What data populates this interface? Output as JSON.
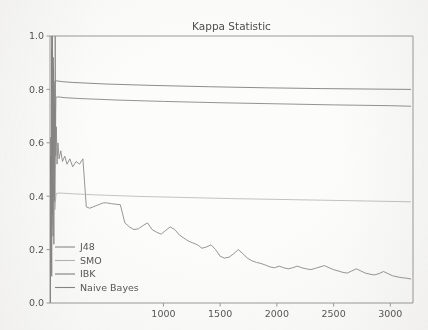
{
  "figure": {
    "title": "Kappa Statistic",
    "background_color": "#fdfdfc"
  },
  "chart_data": {
    "type": "line",
    "title": "Kappa Statistic",
    "xlabel": "",
    "ylabel": "",
    "xlim": [
      0,
      3200
    ],
    "ylim": [
      0.0,
      1.0
    ],
    "grid": false,
    "legend_position": "lower left",
    "xticks": [
      1000,
      1500,
      2000,
      2500,
      3000
    ],
    "xtick_labels": [
      "1000",
      "1500",
      "2000",
      "2500",
      "3000"
    ],
    "yticks": [
      0.0,
      0.2,
      0.4,
      0.6,
      0.8,
      1.0
    ],
    "ytick_labels": [
      "0.0",
      "0.2",
      "0.4",
      "0.6",
      "0.8",
      "1.0"
    ],
    "series": [
      {
        "name": "J48",
        "color": "#8a8886",
        "x": [
          2,
          6,
          10,
          14,
          18,
          22,
          26,
          30,
          34,
          38,
          42,
          46,
          50,
          56,
          62,
          70,
          80,
          95,
          110,
          130,
          150,
          175,
          200,
          230,
          260,
          290,
          320,
          350,
          380,
          410,
          440,
          470,
          500,
          540,
          580,
          620,
          660,
          700,
          740,
          780,
          820,
          860,
          900,
          940,
          980,
          1020,
          1060,
          1100,
          1140,
          1180,
          1220,
          1260,
          1300,
          1340,
          1380,
          1420,
          1460,
          1500,
          1540,
          1580,
          1620,
          1660,
          1700,
          1740,
          1780,
          1820,
          1860,
          1900,
          1940,
          1980,
          2020,
          2060,
          2100,
          2140,
          2180,
          2220,
          2260,
          2300,
          2340,
          2380,
          2420,
          2460,
          2500,
          2540,
          2580,
          2620,
          2660,
          2700,
          2740,
          2780,
          2820,
          2860,
          2900,
          2940,
          2980,
          3020,
          3060,
          3100,
          3140,
          3180
        ],
        "y": [
          0.0,
          0.62,
          0.18,
          0.95,
          0.3,
          1.0,
          0.42,
          0.88,
          0.22,
          0.74,
          0.35,
          1.0,
          0.55,
          0.66,
          0.52,
          0.6,
          0.54,
          0.57,
          0.53,
          0.55,
          0.52,
          0.54,
          0.51,
          0.53,
          0.52,
          0.54,
          0.36,
          0.355,
          0.36,
          0.365,
          0.37,
          0.375,
          0.375,
          0.372,
          0.37,
          0.368,
          0.3,
          0.285,
          0.275,
          0.278,
          0.29,
          0.3,
          0.275,
          0.265,
          0.258,
          0.272,
          0.285,
          0.275,
          0.255,
          0.243,
          0.232,
          0.225,
          0.218,
          0.205,
          0.21,
          0.218,
          0.2,
          0.175,
          0.168,
          0.172,
          0.185,
          0.2,
          0.185,
          0.168,
          0.158,
          0.152,
          0.148,
          0.142,
          0.135,
          0.132,
          0.138,
          0.132,
          0.128,
          0.132,
          0.138,
          0.132,
          0.128,
          0.125,
          0.13,
          0.135,
          0.14,
          0.132,
          0.125,
          0.12,
          0.115,
          0.112,
          0.12,
          0.128,
          0.12,
          0.112,
          0.108,
          0.105,
          0.11,
          0.118,
          0.11,
          0.102,
          0.098,
          0.095,
          0.093,
          0.09
        ]
      },
      {
        "name": "SMO",
        "color": "#b4b2b0",
        "x": [
          2,
          8,
          14,
          20,
          26,
          32,
          40,
          55,
          80,
          120,
          200,
          400,
          800,
          1200,
          1600,
          2000,
          2400,
          2800,
          3180
        ],
        "y": [
          0.0,
          0.48,
          0.12,
          1.0,
          0.28,
          0.86,
          0.35,
          0.41,
          0.412,
          0.411,
          0.409,
          0.405,
          0.399,
          0.395,
          0.391,
          0.388,
          0.385,
          0.382,
          0.379
        ]
      },
      {
        "name": "IBK",
        "color": "#7e7c7a",
        "x": [
          2,
          7,
          12,
          17,
          22,
          28,
          34,
          42,
          55,
          75,
          110,
          200,
          500,
          900,
          1400,
          1900,
          2400,
          2900,
          3180
        ],
        "y": [
          0.0,
          0.55,
          0.15,
          1.0,
          0.33,
          0.92,
          0.4,
          0.83,
          0.832,
          0.831,
          0.829,
          0.826,
          0.82,
          0.815,
          0.81,
          0.806,
          0.803,
          0.801,
          0.8
        ]
      },
      {
        "name": "Naive Bayes",
        "color": "#86837f",
        "x": [
          2,
          9,
          15,
          21,
          27,
          33,
          41,
          52,
          68,
          90,
          130,
          250,
          600,
          1000,
          1500,
          2000,
          2500,
          3000,
          3180
        ],
        "y": [
          0.0,
          0.44,
          0.1,
          1.0,
          0.25,
          0.8,
          0.38,
          0.77,
          0.772,
          0.771,
          0.769,
          0.766,
          0.76,
          0.755,
          0.75,
          0.746,
          0.742,
          0.739,
          0.737
        ]
      }
    ]
  },
  "legend": {
    "entries": [
      {
        "label": "J48",
        "color": "#8a8886"
      },
      {
        "label": "SMO",
        "color": "#b4b2b0"
      },
      {
        "label": "IBK",
        "color": "#7e7c7a"
      },
      {
        "label": "Naive Bayes",
        "color": "#86837f"
      }
    ]
  }
}
